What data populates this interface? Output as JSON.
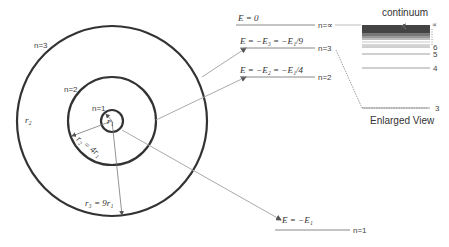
{
  "orbits": {
    "n1_label": "n=1",
    "n2_label": "n=2",
    "n3_label": "n=3",
    "r1_label": "r₁",
    "r2_label": "r₂ = 4r₁",
    "r3_label": "r₃ = 9r₁",
    "outer_r_label": "r₂"
  },
  "energy_levels": [
    {
      "energy_label": "E = 0",
      "n_label": "n=∝"
    },
    {
      "energy_label": "E = −E₃ = −E₁/9",
      "n_label": "n=3"
    },
    {
      "energy_label": "E = −E₂ = −E₁/4",
      "n_label": "n=2"
    },
    {
      "energy_label": "E = −E₁",
      "n_label": "n=1"
    }
  ],
  "enlarged": {
    "continuum_label": "continuum",
    "title": "Enlarged View",
    "level_labels": [
      "∝",
      "6",
      "5",
      "4",
      "3"
    ]
  },
  "colors": {
    "circle": "#333333",
    "connector": "#aaaaaa",
    "level_line": "#888888",
    "continuum_dark": "#444444"
  }
}
